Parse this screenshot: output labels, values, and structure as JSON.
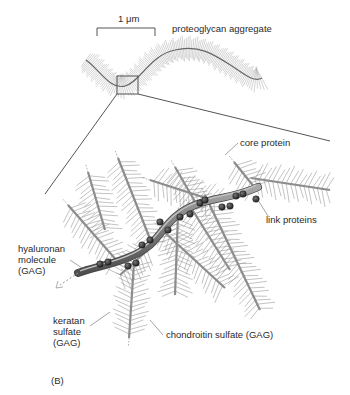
{
  "figure": {
    "panel_label": "(B)",
    "scale_bar": {
      "label": "1 μm"
    },
    "overview_title": "proteoglycan aggregate",
    "labels": {
      "core_protein": "core protein",
      "link_proteins": "link proteins",
      "hyaluronan": [
        "hyaluronan",
        "molecule",
        "(GAG)"
      ],
      "keratan_sulfate": [
        "keratan",
        "sulfate",
        "(GAG)"
      ],
      "chondroitin_sulfate": "chondroitin sulfate (GAG)"
    },
    "colors": {
      "line": "#555555",
      "bristle": "#8a8a8a",
      "hyaluronan_fill": "#7d7d7d",
      "link_protein": "#2b2b2b",
      "text": "#2a2a2a"
    }
  }
}
